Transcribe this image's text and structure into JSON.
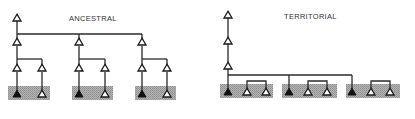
{
  "diagrams": [
    {
      "id": "ancestral",
      "title": "ANCESTRAL",
      "description": "Single ancestor with three descendant lineages, each splitting into two; each lineage shares a shaded territory containing one filled and one open node"
    },
    {
      "id": "territorial",
      "title": "TERRITORIAL",
      "description": "Chain of three open ancestor nodes linked to three shaded territories; each territory has one filled node and a pair of bracketed open nodes"
    }
  ],
  "legend": {
    "open_triangle": "open node",
    "filled_triangle": "filled node",
    "shaded_box": "shaded group region"
  },
  "colors": {
    "shading": "#a8a8a8",
    "line": "#2a2a2a",
    "filled_node": "#111111",
    "open_node": "#ffffff"
  }
}
